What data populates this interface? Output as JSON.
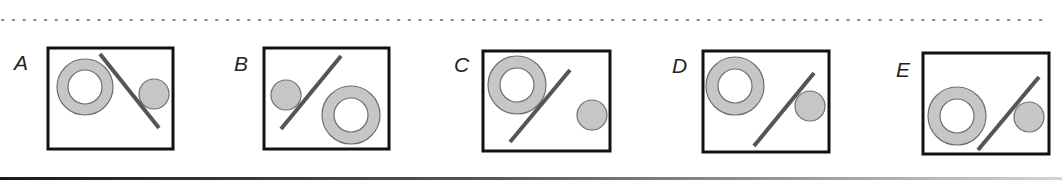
{
  "colors": {
    "shape_fill": "#c6c6c6",
    "shape_stroke": "#6e6e6e",
    "line": "#555555",
    "box_border": "#111111",
    "dots": "#888888"
  },
  "options": [
    {
      "label": "A",
      "label_pos": [
        14,
        70
      ],
      "box": {
        "x": 48,
        "y": 48,
        "w": 125,
        "h": 101
      },
      "ring": {
        "cx": 85,
        "cy": 87,
        "r_outer": 28,
        "r_inner": 17
      },
      "line": {
        "x1": 100,
        "y1": 54,
        "x2": 159,
        "y2": 128
      },
      "circle": {
        "cx": 154,
        "cy": 94,
        "r": 15
      }
    },
    {
      "label": "B",
      "label_pos": [
        234,
        71
      ],
      "box": {
        "x": 264,
        "y": 48,
        "w": 125,
        "h": 101
      },
      "ring": {
        "cx": 351,
        "cy": 115,
        "r_outer": 29,
        "r_inner": 17
      },
      "line": {
        "x1": 281,
        "y1": 129,
        "x2": 341,
        "y2": 56
      },
      "circle": {
        "cx": 286,
        "cy": 95,
        "r": 15
      }
    },
    {
      "label": "C",
      "label_pos": [
        454,
        72
      ],
      "box": {
        "x": 483,
        "y": 51,
        "w": 127,
        "h": 100
      },
      "ring": {
        "cx": 517,
        "cy": 85,
        "r_outer": 29,
        "r_inner": 17
      },
      "line": {
        "x1": 510,
        "y1": 142,
        "x2": 570,
        "y2": 70
      },
      "circle": {
        "cx": 592,
        "cy": 115,
        "r": 15
      }
    },
    {
      "label": "D",
      "label_pos": [
        672,
        73
      ],
      "box": {
        "x": 703,
        "y": 51,
        "w": 126,
        "h": 101
      },
      "ring": {
        "cx": 735,
        "cy": 86,
        "r_outer": 29,
        "r_inner": 17
      },
      "line": {
        "x1": 754,
        "y1": 146,
        "x2": 814,
        "y2": 73
      },
      "circle": {
        "cx": 810,
        "cy": 106,
        "r": 15
      }
    },
    {
      "label": "E",
      "label_pos": [
        896,
        77
      ],
      "box": {
        "x": 923,
        "y": 53,
        "w": 126,
        "h": 101
      },
      "ring": {
        "cx": 957,
        "cy": 116,
        "r_outer": 29,
        "r_inner": 17
      },
      "line": {
        "x1": 978,
        "y1": 150,
        "x2": 1039,
        "y2": 77
      },
      "circle": {
        "cx": 1029,
        "cy": 117,
        "r": 15
      }
    }
  ]
}
